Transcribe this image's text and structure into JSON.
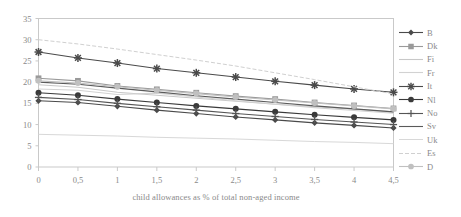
{
  "chart_data": {
    "type": "line",
    "title": "",
    "xlabel": "child allowances as % of total non-aged income",
    "ylabel": "",
    "xlim": [
      0,
      4.5
    ],
    "ylim": [
      0,
      35
    ],
    "grid": false,
    "legend_position": "right",
    "x_tick_labels": [
      "0",
      "0,5",
      "1",
      "1,5",
      "2",
      "2,5",
      "3",
      "3,5",
      "4",
      "4,5"
    ],
    "y_tick_labels": [
      "0",
      "5",
      "10",
      "15",
      "20",
      "25",
      "30",
      "35"
    ],
    "x": [
      0,
      0.5,
      1,
      1.5,
      2,
      2.5,
      3,
      3.5,
      4,
      4.5
    ],
    "series": [
      {
        "name": "B",
        "marker": "diamond",
        "color": "#4a4a4a",
        "values": [
          15.6,
          15.2,
          14.3,
          13.4,
          12.6,
          11.8,
          11.1,
          10.4,
          9.8,
          9.2
        ]
      },
      {
        "name": "Dk",
        "marker": "square",
        "color": "#9a9a9a",
        "values": [
          20.9,
          20.3,
          19.1,
          18.3,
          17.5,
          16.7,
          16.0,
          15.2,
          14.5,
          13.8
        ]
      },
      {
        "name": "Fi",
        "marker": "none",
        "color": "#c8c8c8",
        "values": [
          19.4,
          18.8,
          17.6,
          16.9,
          16.2,
          15.5,
          14.8,
          14.2,
          13.6,
          13.0
        ]
      },
      {
        "name": "Fr",
        "marker": "none",
        "color": "#d2d2d2",
        "values": [
          18.4,
          18.1,
          17.1,
          17.4,
          16.5,
          15.6,
          14.8,
          14.0,
          13.3,
          12.7
        ]
      },
      {
        "name": "It",
        "marker": "star",
        "color": "#4a4a4a",
        "values": [
          27.1,
          25.7,
          24.5,
          23.2,
          22.2,
          21.2,
          20.2,
          19.3,
          18.4,
          17.6
        ]
      },
      {
        "name": "Nl",
        "marker": "circle",
        "color": "#3a3a3a",
        "values": [
          17.5,
          16.9,
          16.0,
          15.2,
          14.4,
          13.7,
          13.0,
          12.3,
          11.7,
          11.1
        ]
      },
      {
        "name": "No",
        "marker": "plus",
        "color": "#555555",
        "values": [
          16.4,
          15.9,
          15.0,
          14.2,
          13.4,
          12.6,
          11.9,
          11.2,
          10.6,
          10.0
        ]
      },
      {
        "name": "Sv",
        "marker": "none",
        "color": "#5a5a5a",
        "values": [
          20.0,
          19.5,
          18.6,
          17.7,
          16.8,
          16.0,
          15.2,
          14.4,
          13.7,
          13.0
        ]
      },
      {
        "name": "Uk",
        "marker": "none",
        "color": "#d8d8d8",
        "values": [
          7.7,
          7.5,
          7.3,
          7.0,
          6.8,
          6.6,
          6.3,
          6.0,
          5.8,
          5.5
        ]
      },
      {
        "name": "Es",
        "marker": "none",
        "color": "#d0d0d0",
        "values": [
          30.0,
          29.0,
          27.8,
          26.5,
          25.2,
          23.8,
          22.2,
          20.6,
          18.9,
          17.2
        ]
      },
      {
        "name": "D",
        "marker": "dot",
        "color": "#c0c0c0",
        "values": [
          20.3,
          19.8,
          18.9,
          18.1,
          17.3,
          16.5,
          15.8,
          15.1,
          14.4,
          13.7
        ]
      }
    ]
  }
}
